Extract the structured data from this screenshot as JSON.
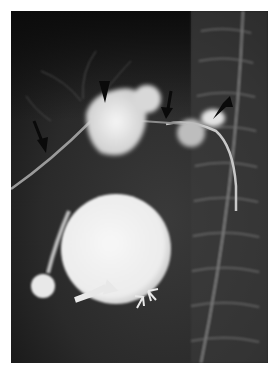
{
  "image": {
    "type": "radiograph",
    "description": "Contrast cholangiogram-style X-ray with annotated arrows",
    "colors": {
      "background": "#ffffff",
      "film_dark": "#1e1e1e",
      "contrast_bright": "#f2f2f2",
      "arrow_black": "#0a0a0a",
      "arrow_white": "#e8e8e8"
    }
  },
  "annotations": [
    {
      "kind": "black-arrow",
      "label": "left black arrow"
    },
    {
      "kind": "black-arrowhead",
      "label": "left arrowhead"
    },
    {
      "kind": "black-arrow",
      "label": "center black arrow"
    },
    {
      "kind": "black-arrowhead",
      "label": "right arrowhead"
    },
    {
      "kind": "white-curved-arrow",
      "label": "curved white arrow"
    },
    {
      "kind": "open-arrow",
      "label": "open arrows pair"
    }
  ]
}
